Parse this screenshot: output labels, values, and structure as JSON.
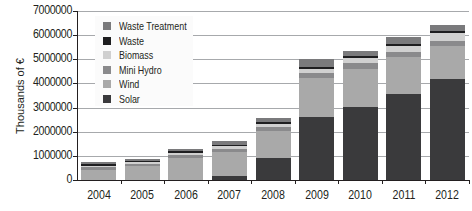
{
  "chart_data": {
    "type": "bar",
    "stacked": true,
    "title": "",
    "xlabel": "",
    "ylabel": "Thousands of €",
    "ylim": [
      0,
      7000000
    ],
    "yticks": [
      "0",
      "1000000",
      "2000000",
      "3000000",
      "4000000",
      "5000000",
      "6000000",
      "7000000"
    ],
    "grid": true,
    "legend_position": "upper-left inside",
    "categories": [
      "2004",
      "2005",
      "2006",
      "2007",
      "2008",
      "2009",
      "2010",
      "2011",
      "2012"
    ],
    "series": [
      {
        "name": "Solar",
        "color": "#3a3a3c",
        "values": [
          10000,
          10000,
          20000,
          160000,
          930000,
          2620000,
          3030000,
          3560000,
          4200000
        ]
      },
      {
        "name": "Wind",
        "color": "#a9a9a9",
        "values": [
          410000,
          580000,
          900000,
          990000,
          1120000,
          1600000,
          1570000,
          1530000,
          1330000
        ]
      },
      {
        "name": "Mini Hydro",
        "color": "#8a8a8c",
        "values": [
          120000,
          80000,
          120000,
          120000,
          160000,
          210000,
          250000,
          210000,
          230000
        ]
      },
      {
        "name": "Biomass",
        "color": "#d0d0d0",
        "values": [
          40000,
          80000,
          80000,
          120000,
          110000,
          170000,
          210000,
          250000,
          330000
        ]
      },
      {
        "name": "Waste",
        "color": "#1e1e20",
        "values": [
          80000,
          40000,
          80000,
          80000,
          80000,
          80000,
          80000,
          80000,
          80000
        ]
      },
      {
        "name": "Waste Treatment",
        "color": "#7a7a7c",
        "values": [
          80000,
          80000,
          80000,
          150000,
          170000,
          330000,
          210000,
          290000,
          250000
        ]
      }
    ]
  },
  "legend": {
    "items": [
      {
        "label": "Waste Treatment",
        "color": "#7a7a7c"
      },
      {
        "label": "Waste",
        "color": "#1e1e20"
      },
      {
        "label": "Biomass",
        "color": "#d0d0d0"
      },
      {
        "label": "Mini Hydro",
        "color": "#8a8a8c"
      },
      {
        "label": "Wind",
        "color": "#a9a9a9"
      },
      {
        "label": "Solar",
        "color": "#3a3a3c"
      }
    ]
  }
}
